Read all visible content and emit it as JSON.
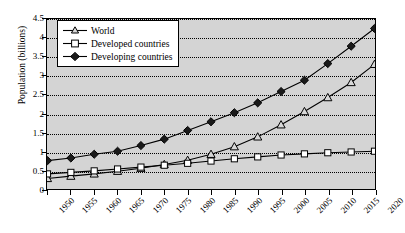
{
  "chart_data": {
    "type": "line",
    "title": "",
    "xlabel": "",
    "ylabel": "Population (billions)",
    "x": [
      1950,
      1955,
      1960,
      1965,
      1970,
      1975,
      1980,
      1985,
      1990,
      1995,
      2000,
      2005,
      2010,
      2015,
      2020
    ],
    "xticklabels": [
      "1950",
      "1955",
      "1960",
      "1965",
      "1970",
      "1975",
      "1980",
      "1985",
      "1990",
      "1995",
      "2000",
      "2005",
      "2010",
      "2015",
      "2020"
    ],
    "yticklabels": [
      "0",
      "0.5",
      "1",
      "1.5",
      "2",
      "2.5",
      "3",
      "3.5",
      "4",
      "4.5"
    ],
    "yticks": [
      0,
      0.5,
      1,
      1.5,
      2,
      2.5,
      3,
      3.5,
      4,
      4.5
    ],
    "ylim": [
      0,
      4.5
    ],
    "xlim": [
      1950,
      2020
    ],
    "grid": "horizontal-dotted",
    "legend_position": "top-left",
    "series": [
      {
        "name": "World",
        "marker": "triangle",
        "marker_fill": "open",
        "values": [
          0.28,
          0.34,
          0.4,
          0.47,
          0.55,
          0.65,
          0.76,
          0.92,
          1.12,
          1.38,
          1.7,
          2.05,
          2.42,
          2.82,
          3.3
        ]
      },
      {
        "name": "Developed countries",
        "marker": "square",
        "marker_fill": "open",
        "values": [
          0.4,
          0.44,
          0.48,
          0.53,
          0.58,
          0.63,
          0.68,
          0.74,
          0.8,
          0.85,
          0.9,
          0.93,
          0.96,
          0.98,
          1.0
        ]
      },
      {
        "name": "Developing countries",
        "marker": "diamond",
        "marker_fill": "filled",
        "values": [
          0.75,
          0.82,
          0.92,
          1.0,
          1.15,
          1.32,
          1.55,
          1.78,
          2.02,
          2.28,
          2.58,
          2.88,
          3.32,
          3.78,
          4.25
        ]
      }
    ]
  },
  "legend": {
    "items": [
      {
        "label": "World"
      },
      {
        "label": "Developed countries"
      },
      {
        "label": "Developing countries"
      }
    ]
  },
  "colors": {
    "plot_background": "#d4d4d4",
    "axis": "#000000",
    "grid": "#000000",
    "series_line": "#000000",
    "legend_background": "#ffffff"
  }
}
